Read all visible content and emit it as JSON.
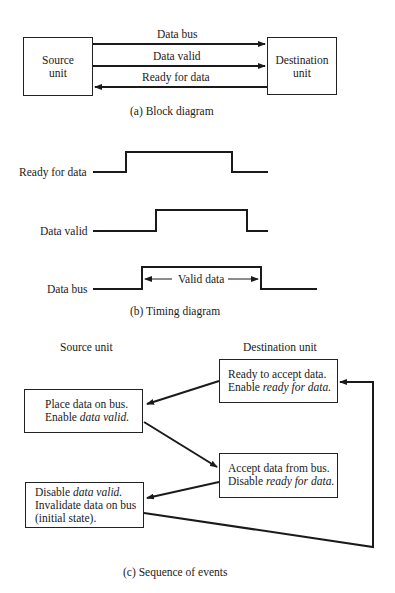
{
  "block_diagram": {
    "source_box": {
      "line1": "Source",
      "line2": "unit"
    },
    "destination_box": {
      "line1": "Destination",
      "line2": "unit"
    },
    "signals": [
      {
        "label": "Data bus",
        "direction": "source-to-destination"
      },
      {
        "label": "Data valid",
        "direction": "source-to-destination"
      },
      {
        "label": "Ready for data",
        "direction": "destination-to-source"
      }
    ],
    "caption": "(a)   Block diagram"
  },
  "timing_diagram": {
    "signals": [
      {
        "label": "Ready for data"
      },
      {
        "label": "Data valid"
      },
      {
        "label": "Data bus",
        "annotation": "Valid data"
      }
    ],
    "caption": "(b)   Timing diagram"
  },
  "sequence": {
    "column_headers": {
      "source": "Source unit",
      "destination": "Destination unit"
    },
    "boxes": {
      "ready": {
        "line1": "Ready to accept data.",
        "line2_prefix": "Enable ",
        "line2_italic": "ready for data."
      },
      "place": {
        "line1": "Place data on bus.",
        "line2_prefix": "Enable ",
        "line2_italic": "data valid."
      },
      "accept": {
        "line1": "Accept data from bus.",
        "line2_prefix": "Disable ",
        "line2_italic": "ready for data."
      },
      "disable": {
        "line1_prefix": "Disable ",
        "line1_italic": "data valid.",
        "line2": "Invalidate data on bus",
        "line3": "(initial state)."
      }
    },
    "caption": "(c)   Sequence of events"
  }
}
